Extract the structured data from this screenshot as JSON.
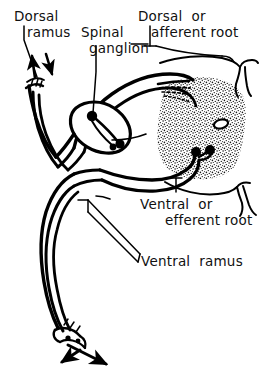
{
  "figure": {
    "type": "anatomical-line-diagram",
    "style": {
      "stroke_color": "#000000",
      "background_color": "#ffffff",
      "gray_matter_fill": "stipple",
      "line_style": "hand-drawn ink"
    }
  },
  "labels": {
    "dorsal_ramus": {
      "line1": "Dorsal",
      "line2": "ramus"
    },
    "spinal_ganglion": {
      "line1": "Spinal",
      "line2": "ganglion"
    },
    "dorsal_root": {
      "line1": "Dorsal  or",
      "line2": "afferent root"
    },
    "ventral_root": {
      "line1": "Ventral  or",
      "line2": "efferent root"
    },
    "ventral_ramus": {
      "line1": "Ventral  ramus"
    }
  },
  "structures": [
    {
      "name": "spinal-cord-gray-matter",
      "description": "stippled butterfly-shaped gray matter"
    },
    {
      "name": "central-canal",
      "description": "small oval opening in center of gray matter"
    },
    {
      "name": "dorsal-median-sulcus",
      "description": "notch at top of cord midline"
    },
    {
      "name": "ventral-median-fissure",
      "description": "notch at bottom of cord midline"
    },
    {
      "name": "dorsal-root",
      "description": "sensory root entering dorsal horn"
    },
    {
      "name": "ventral-root",
      "description": "motor root leaving ventral horn"
    },
    {
      "name": "spinal-ganglion",
      "description": "swelling with sensory cell bodies on dorsal root"
    },
    {
      "name": "spinal-nerve-trunk",
      "description": "mixed nerve formed by union of roots"
    },
    {
      "name": "dorsal-ramus",
      "description": "posterior branch of spinal nerve, cut end with arrows"
    },
    {
      "name": "ventral-ramus",
      "description": "anterior branch of spinal nerve, cut end with arrows"
    },
    {
      "name": "afferent-arrow",
      "description": "arrow pointing toward cord (sensory direction)"
    },
    {
      "name": "efferent-arrow",
      "description": "arrow pointing away from cord (motor direction)"
    }
  ]
}
